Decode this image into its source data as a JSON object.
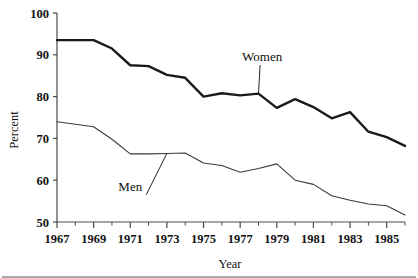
{
  "chart_data": {
    "type": "line",
    "title": "",
    "xlabel": "Year",
    "ylabel": "Percent",
    "xlim": [
      1967,
      1986
    ],
    "ylim": [
      50,
      100
    ],
    "grid": false,
    "legend_position": "inline-annotations",
    "x": [
      1967,
      1968,
      1969,
      1970,
      1971,
      1972,
      1973,
      1974,
      1975,
      1976,
      1977,
      1978,
      1979,
      1980,
      1981,
      1982,
      1983,
      1984,
      1985,
      1986
    ],
    "y_ticks": [
      50,
      60,
      70,
      80,
      90,
      100
    ],
    "y_tick_labels": [
      "50",
      "60",
      "70",
      "80",
      "90",
      "100"
    ],
    "x_ticks": [
      1967,
      1969,
      1971,
      1973,
      1975,
      1977,
      1979,
      1981,
      1983,
      1985
    ],
    "x_tick_labels": [
      "1967",
      "1969",
      "1971",
      "1973",
      "1975",
      "1977",
      "1979",
      "1981",
      "1983",
      "1985"
    ],
    "x_minor_ticks": [
      1968,
      1970,
      1972,
      1974,
      1976,
      1978,
      1980,
      1982,
      1984,
      1986
    ],
    "series": [
      {
        "name": "Women",
        "color": "#1a1a1a",
        "line_width": 2.4,
        "values": [
          93.5,
          93.5,
          93.5,
          91.5,
          87.5,
          87.3,
          85.2,
          84.5,
          80.0,
          80.8,
          80.3,
          80.7,
          77.3,
          79.4,
          77.5,
          74.8,
          76.3,
          71.6,
          70.3,
          68.2
        ]
      },
      {
        "name": "Men",
        "color": "#3a3a3a",
        "line_width": 1.1,
        "values": [
          74.0,
          73.4,
          72.8,
          69.8,
          66.3,
          66.3,
          66.4,
          66.5,
          64.1,
          63.5,
          61.9,
          62.8,
          63.9,
          60.0,
          59.0,
          56.3,
          55.2,
          54.3,
          53.9,
          51.7
        ]
      }
    ],
    "annotations": [
      {
        "text": "Women",
        "x": 1978.2,
        "y": 88.5,
        "anchor_x": 1978.0,
        "anchor_y": 80.7
      },
      {
        "text": "Men",
        "x": 1971.0,
        "y": 57.5,
        "anchor_x": 1973.0,
        "anchor_y": 66.4
      }
    ]
  },
  "axes": {
    "y_title": "Percent",
    "x_title": "Year"
  }
}
